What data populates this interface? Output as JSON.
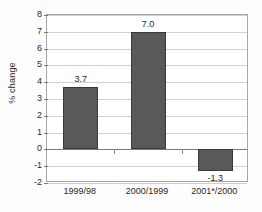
{
  "chart_data": {
    "type": "bar",
    "title": "",
    "subtitle": "",
    "xlabel": "",
    "ylabel": "% change",
    "categories": [
      "1999/98",
      "2000/1999",
      "2001*/2000"
    ],
    "values": [
      3.7,
      7.0,
      -1.3
    ],
    "data_labels": [
      "3.7",
      "7.0",
      "-1.3"
    ],
    "ylim": [
      -2,
      8
    ],
    "ytick_labels": [
      "8",
      "7",
      "6",
      "5",
      "4",
      "3",
      "2",
      "1",
      "0",
      "-1",
      "-2"
    ],
    "ytick_values": [
      8,
      7,
      6,
      5,
      4,
      3,
      2,
      1,
      0,
      -1,
      -2
    ],
    "grid": true,
    "legend": false,
    "legend_position": "none",
    "series": [
      {
        "name": "% change",
        "values": [
          3.7,
          7.0,
          -1.3
        ]
      }
    ],
    "colors": {
      "bar_fill": "#595959",
      "bar_border": "#3a3a3a",
      "gridline": "#d0d0d0",
      "zero_line": "#7a7a7a",
      "axis_frame": "#a6a6a6",
      "text": "#1f1f1f",
      "plot_background": "#ffffff",
      "figure_background": "#fdfdfd"
    }
  }
}
